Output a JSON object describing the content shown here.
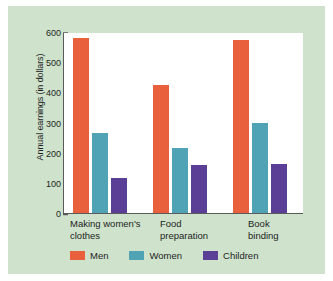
{
  "chart_data": {
    "type": "bar",
    "title": "",
    "subtitle": "",
    "xlabel": "",
    "ylabel": "Annual earnings (in dollars)",
    "ylim": [
      0,
      600
    ],
    "yticks": [
      0,
      100,
      200,
      300,
      400,
      500,
      600
    ],
    "ytick_labels": [
      "0",
      "100",
      "200",
      "300",
      "400",
      "500",
      "600"
    ],
    "grid": false,
    "legend_position": "bottom",
    "categories": [
      "Making women's\nclothes",
      "Food\npreparation",
      "Book\nbinding"
    ],
    "series": [
      {
        "name": "Men",
        "color": "#e8603c",
        "values": [
          580,
          425,
          575
        ]
      },
      {
        "name": "Women",
        "color": "#4fa3b5",
        "values": [
          265,
          215,
          297
        ]
      },
      {
        "name": "Children",
        "color": "#5b3e96",
        "values": [
          115,
          158,
          162
        ]
      }
    ]
  },
  "colors": {
    "panel_background": "#cfe3cc",
    "plot_background": "#ffffff",
    "axis": "#5a5a5a",
    "text": "#1d1d1d",
    "men": "#e8603c",
    "women": "#4fa3b5",
    "children": "#5b3e96"
  }
}
